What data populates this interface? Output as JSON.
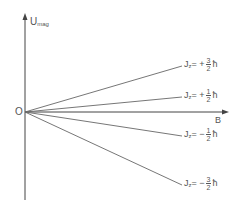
{
  "diagram": {
    "y_axis": {
      "label_main": "U",
      "label_sub": "mag"
    },
    "x_axis": {
      "label": "B"
    },
    "origin": {
      "label": "O"
    },
    "lines": [
      {
        "name": "jz-plus-3-2",
        "prefix": "J",
        "sub": "z",
        "sign": "= +",
        "num": "3",
        "den": "2",
        "unit": "ħ",
        "end": [
          182,
          66
        ],
        "label_pos": [
          184,
          57
        ]
      },
      {
        "name": "jz-plus-1-2",
        "prefix": "J",
        "sub": "z",
        "sign": "= +",
        "num": "1",
        "den": "2",
        "unit": "ħ",
        "end": [
          182,
          97
        ],
        "label_pos": [
          184,
          88
        ]
      },
      {
        "name": "jz-minus-1-2",
        "prefix": "J",
        "sub": "z",
        "sign": "= −",
        "num": "1",
        "den": "2",
        "unit": "ħ",
        "end": [
          182,
          136
        ],
        "label_pos": [
          184,
          127
        ]
      },
      {
        "name": "jz-minus-3-2",
        "prefix": "J",
        "sub": "z",
        "sign": "= −",
        "num": "3",
        "den": "2",
        "unit": "ħ",
        "end": [
          182,
          185
        ],
        "label_pos": [
          184,
          176
        ]
      }
    ],
    "colors": {
      "axis": "#444444",
      "line": "#666666",
      "text": "#555555"
    }
  }
}
